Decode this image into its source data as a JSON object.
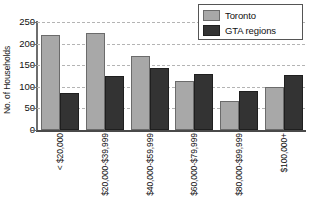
{
  "chart_data": {
    "type": "bar",
    "title": "",
    "xlabel": "",
    "ylabel": "No. of Households",
    "ylim": [
      0,
      250
    ],
    "ytick_step": 50,
    "yticks": [
      250,
      200,
      150,
      100,
      50,
      0
    ],
    "ytick_labels": [
      "250",
      "200",
      "150",
      "100",
      "50",
      "0"
    ],
    "grid": true,
    "grid_style": "dashed-horizontal",
    "legend_position": "top-right",
    "xtick_label_rotation": -90,
    "categories": [
      "< $20,000",
      "$20,000-$39,999",
      "$40,000-$59,999",
      "$60,000-$79,999",
      "$80,000-$99,999",
      "$100,000+"
    ],
    "series": [
      {
        "name": "Toronto",
        "color": "#a8a8a8",
        "values": [
          220,
          225,
          172,
          113,
          67,
          100
        ]
      },
      {
        "name": "GTA regions",
        "color": "#333333",
        "values": [
          85,
          125,
          143,
          130,
          90,
          127
        ]
      }
    ]
  },
  "legend": {
    "entries": [
      {
        "label": "Toronto",
        "swatch_name": "legend-swatch-toronto"
      },
      {
        "label": "GTA regions",
        "swatch_name": "legend-swatch-gta-regions"
      }
    ]
  },
  "axes": {
    "y_title": "No. of Households"
  }
}
